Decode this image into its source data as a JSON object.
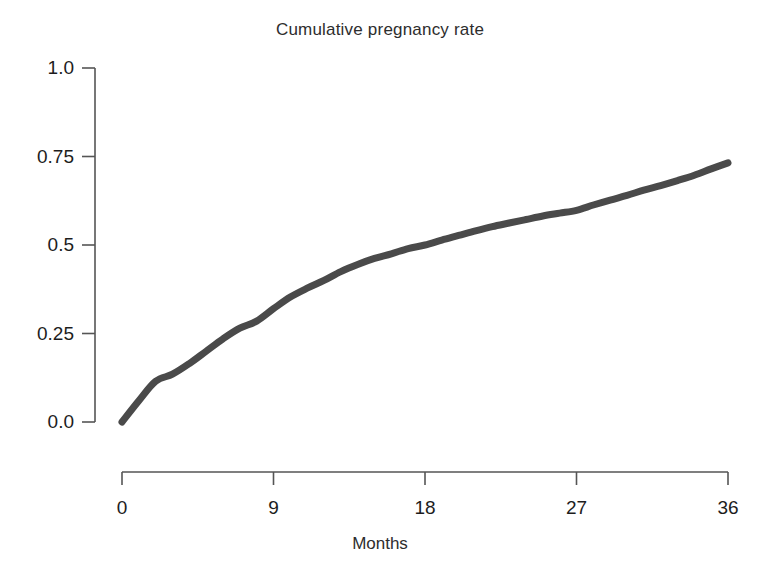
{
  "chart_data": {
    "type": "line",
    "title": "Cumulative pregnancy rate",
    "xlabel": "Months",
    "ylabel": "",
    "xlim": [
      0,
      36
    ],
    "ylim": [
      0,
      1
    ],
    "grid": false,
    "legend": null,
    "line_color": "#4a4a4a",
    "line_width": 7,
    "background_color": "#ffffff",
    "axis_color": "#555555",
    "xticks": [
      0,
      9,
      18,
      27,
      36
    ],
    "xtick_labels": [
      "0",
      "9",
      "18",
      "27",
      "36"
    ],
    "yticks": [
      0,
      0.25,
      0.5,
      0.75,
      1
    ],
    "ytick_labels": [
      "0.0",
      "0.25",
      "0.5",
      "0.75",
      "1.0"
    ],
    "series": [
      {
        "name": "Cumulative pregnancy rate",
        "x": [
          0,
          1,
          2,
          3,
          4,
          5,
          6,
          7,
          8,
          9,
          10,
          11,
          12,
          13,
          14,
          15,
          16,
          17,
          18,
          19,
          20,
          21,
          22,
          23,
          24,
          25,
          26,
          27,
          28,
          29,
          30,
          31,
          32,
          33,
          34,
          35,
          36
        ],
        "values": [
          0.0,
          0.06,
          0.115,
          0.135,
          0.165,
          0.2,
          0.235,
          0.265,
          0.285,
          0.32,
          0.353,
          0.378,
          0.4,
          0.425,
          0.445,
          0.462,
          0.475,
          0.49,
          0.5,
          0.514,
          0.527,
          0.54,
          0.552,
          0.562,
          0.572,
          0.582,
          0.59,
          0.598,
          0.613,
          0.627,
          0.64,
          0.655,
          0.668,
          0.682,
          0.697,
          0.715,
          0.732
        ]
      }
    ],
    "annotations": []
  },
  "figure": {
    "title": "Cumulative pregnancy rate",
    "xlabel": "Months"
  }
}
